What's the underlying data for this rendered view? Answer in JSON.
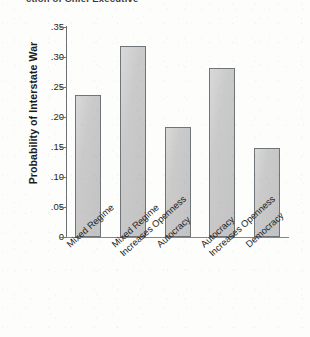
{
  "page": {
    "top_fragment_text": "ction of Chief Executive",
    "background_color": "#fdfdfb"
  },
  "chart_data": {
    "type": "bar",
    "title": "",
    "xlabel": "",
    "ylabel": "Probability of Interstate War",
    "categories": [
      "Mixed Regime",
      "Mixed Regime Increases Openness",
      "Autocracy",
      "Autocracy Increases Openness",
      "Democracy"
    ],
    "category_lines": [
      [
        "Mixed Regime"
      ],
      [
        "Mixed Regime",
        "Increases Openness"
      ],
      [
        "Autocracy"
      ],
      [
        "Autocracy",
        "Increases Openness"
      ],
      [
        "Democracy"
      ]
    ],
    "values": [
      0.237,
      0.319,
      0.183,
      0.282,
      0.148
    ],
    "ylim": [
      0,
      0.35
    ],
    "yticks": [
      0,
      0.05,
      0.1,
      0.15,
      0.2,
      0.25,
      0.3,
      0.35
    ],
    "ytick_labels": [
      "0",
      ".05",
      ".10",
      ".15",
      ".20",
      ".25",
      ".30",
      ".35"
    ],
    "grid": false,
    "legend": false,
    "bar_fill_color": "#c9c9c9",
    "bar_border_color": "#6f7478",
    "axis_color": "#6d7074"
  }
}
